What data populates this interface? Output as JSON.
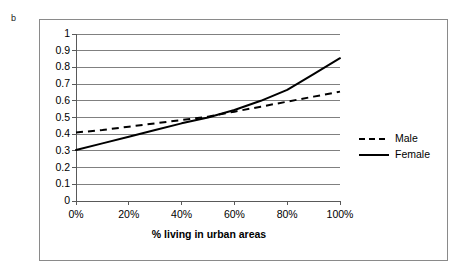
{
  "panel": {
    "letter": "b"
  },
  "legend": {
    "position": "right",
    "entries": [
      {
        "label": "Male",
        "style": "dashed"
      },
      {
        "label": "Female",
        "style": "solid"
      }
    ]
  },
  "axes": {
    "y_ticks": [
      "1",
      "0.9",
      "0.8",
      "0.7",
      "0.6",
      "0.5",
      "0.4",
      "0.3",
      "0.2",
      "0.1",
      "0"
    ],
    "x_ticks": [
      "0%",
      "20%",
      "40%",
      "60%",
      "80%",
      "100%"
    ],
    "x_title": "% living in urban areas",
    "y_title": ""
  },
  "colors": {
    "line": "#000000",
    "gridline": "#808080",
    "frame": "#8a8a8a",
    "background": "#ffffff"
  },
  "chart_data": {
    "type": "line",
    "title": "",
    "subtitle": "",
    "xlabel": "% living in urban areas",
    "ylabel": "",
    "xlim": [
      0,
      100
    ],
    "ylim": [
      0,
      1
    ],
    "grid": true,
    "legend_position": "right",
    "x": [
      0,
      10,
      20,
      30,
      40,
      50,
      60,
      70,
      80,
      90,
      100
    ],
    "series": [
      {
        "name": "Male",
        "style": "dashed",
        "values": [
          0.41,
          0.425,
          0.445,
          0.465,
          0.485,
          0.505,
          0.535,
          0.565,
          0.595,
          0.625,
          0.655
        ]
      },
      {
        "name": "Female",
        "style": "solid",
        "values": [
          0.305,
          0.345,
          0.385,
          0.425,
          0.465,
          0.5,
          0.545,
          0.6,
          0.665,
          0.76,
          0.855
        ]
      }
    ],
    "annotations": [
      {
        "text": "b",
        "kind": "panel-letter"
      }
    ]
  }
}
